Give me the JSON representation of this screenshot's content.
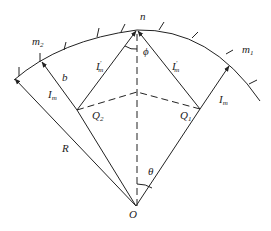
{
  "diagram": {
    "type": "geometry",
    "labels": {
      "n": "n",
      "m1": "m",
      "m1_sub": "1",
      "m2": "m",
      "m2_sub": "2",
      "b": "b",
      "Im_left": "I",
      "Im_left_sub": "m",
      "Im_right": "I",
      "Im_right_sub": "m",
      "Ipm_left": "I",
      "Ipm_left_sup": "′",
      "Ipm_left_sub": "m",
      "Ipm_right": "I",
      "Ipm_right_sup": "′",
      "Ipm_right_sub": "m",
      "Q1": "Q",
      "Q1_sub": "1",
      "Q2": "Q",
      "Q2_sub": "2",
      "R": "R",
      "O": "O",
      "theta": "θ",
      "phi": "ϕ"
    },
    "points": {
      "O": [
        136,
        206
      ],
      "n": [
        137,
        30
      ],
      "m2_arc": [
        41,
        61
      ],
      "left_end": [
        15,
        79
      ],
      "m1_arc": [
        229,
        65
      ],
      "Q1": [
        200,
        109
      ],
      "Q2": [
        77,
        110
      ],
      "center": [
        137,
        92
      ]
    }
  }
}
